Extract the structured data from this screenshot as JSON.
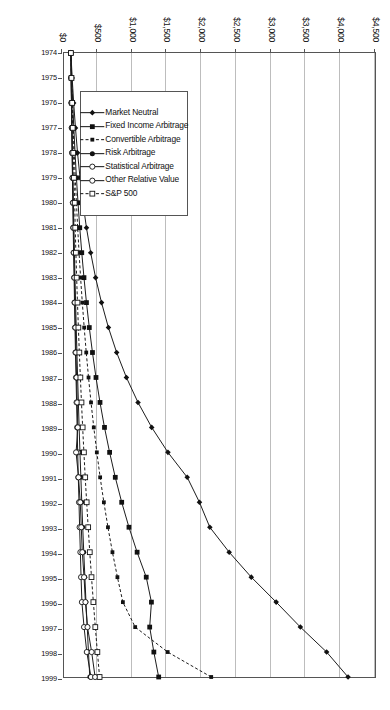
{
  "chart_data": {
    "type": "line",
    "title": "",
    "xlabel": "",
    "ylabel": "",
    "orientation": "rotated-90-clockwise",
    "x": [
      1974,
      1975,
      1976,
      1977,
      1978,
      1979,
      1980,
      1981,
      1982,
      1983,
      1984,
      1985,
      1986,
      1987,
      1988,
      1989,
      1990,
      1991,
      1992,
      1993,
      1994,
      1995,
      1996,
      1997,
      1998,
      1999
    ],
    "categories": [
      "1974",
      "1975",
      "1976",
      "1977",
      "1978",
      "1979",
      "1980",
      "1981",
      "1982",
      "1983",
      "1984",
      "1985",
      "1986",
      "1987",
      "1988",
      "1989",
      "1990",
      "1991",
      "1992",
      "1993",
      "1994",
      "1995",
      "1996",
      "1997",
      "1998",
      "1999"
    ],
    "value_axis": {
      "ticks": [
        0,
        500,
        1000,
        1500,
        2000,
        2500,
        3000,
        3500,
        4000,
        4500
      ],
      "tick_labels": [
        "$0",
        "$500",
        "$1,000",
        "$1,500",
        "$2,000",
        "$2,500",
        "$3,000",
        "$3,500",
        "$4,000",
        "$4,500"
      ],
      "min": 0,
      "max": 4500,
      "grid": true
    },
    "legend_position": "inside-lower-left",
    "series": [
      {
        "name": "Market Neutral",
        "marker": "filled-diamond",
        "dash": "solid",
        "color": "#1a1a1a",
        "values": [
          100,
          118,
          140,
          166,
          196,
          232,
          274,
          325,
          386,
          457,
          543,
          643,
          762,
          903,
          1071,
          1269,
          1504,
          1783,
          1960,
          2110,
          2390,
          2710,
          3070,
          3420,
          3800,
          4110
        ]
      },
      {
        "name": "Fixed Income Arbitrage",
        "marker": "filled-square",
        "dash": "solid",
        "color": "#1a1a1a",
        "values": [
          100,
          112,
          126,
          142,
          160,
          180,
          203,
          228,
          257,
          289,
          325,
          366,
          412,
          463,
          521,
          586,
          660,
          742,
          835,
          940,
          1058,
          1190,
          1265,
          1240,
          1300,
          1370
        ]
      },
      {
        "name": "Convertible Arbitrage",
        "marker": "filled-small-square",
        "dash": "dashed",
        "color": "#1a1a1a",
        "values": [
          100,
          110,
          122,
          134,
          148,
          163,
          180,
          198,
          218,
          240,
          265,
          292,
          322,
          355,
          391,
          431,
          475,
          523,
          577,
          636,
          701,
          773,
          852,
          1030,
          1500,
          2130
        ]
      },
      {
        "name": "Risk Arbitrage",
        "marker": "filled-circle",
        "dash": "solid",
        "color": "#1a1a1a",
        "values": [
          100,
          104,
          110,
          116,
          122,
          129,
          136,
          143,
          151,
          159,
          168,
          177,
          187,
          197,
          208,
          219,
          231,
          244,
          257,
          271,
          286,
          302,
          318,
          336,
          354,
          373
        ]
      },
      {
        "name": "Statistical Arbitrage",
        "marker": "open-circle",
        "dash": "solid",
        "color": "#1a1a1a",
        "values": [
          100,
          103,
          107,
          112,
          117,
          122,
          128,
          133,
          139,
          146,
          152,
          159,
          166,
          174,
          182,
          190,
          198,
          207,
          217,
          226,
          237,
          247,
          259,
          290,
          330,
          390
        ]
      },
      {
        "name": "Other Relative Value",
        "marker": "open-circle",
        "dash": "solid",
        "color": "#1a1a1a",
        "values": [
          100,
          104,
          109,
          114,
          119,
          125,
          131,
          137,
          144,
          151,
          158,
          165,
          173,
          182,
          191,
          200,
          175,
          210,
          235,
          250,
          265,
          290,
          310,
          340,
          400,
          450
        ]
      },
      {
        "name": "S&P 500",
        "marker": "open-square",
        "dash": "dashed",
        "color": "#1a1a1a",
        "values": [
          100,
          108,
          118,
          126,
          134,
          144,
          155,
          162,
          172,
          183,
          195,
          208,
          222,
          237,
          253,
          270,
          288,
          307,
          328,
          350,
          373,
          398,
          425,
          453,
          483,
          515
        ]
      }
    ]
  },
  "legend": {
    "items": [
      {
        "label": "Market Neutral"
      },
      {
        "label": "Fixed Income Arbitrage"
      },
      {
        "label": "Convertible Arbitrage"
      },
      {
        "label": "Risk Arbitrage"
      },
      {
        "label": "Statistical Arbitrage"
      },
      {
        "label": "Other Relative Value"
      },
      {
        "label": "S&P 500"
      }
    ]
  }
}
